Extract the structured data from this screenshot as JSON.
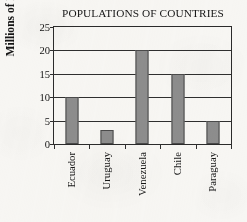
{
  "chart_data": {
    "type": "bar",
    "title": "POPULATIONS OF COUNTRIES",
    "xlabel": "",
    "ylabel": "Millions of People",
    "categories": [
      "Ecuador",
      "Uruguay",
      "Venezuela",
      "Chile",
      "Paraguay"
    ],
    "values": [
      10,
      3,
      20,
      15,
      5
    ],
    "ylim": [
      0,
      25
    ],
    "ytick_labels": [
      "0",
      "5",
      "10",
      "15",
      "20",
      "25"
    ],
    "ytick_values": [
      0,
      5,
      10,
      15,
      20,
      25
    ],
    "grid": "horizontal",
    "legend": "none",
    "bar_color": "#8d8d8d",
    "bar_edge_color": "#4a4a4a",
    "axis_color": "#2f2f2f",
    "background_color": "#f7f6f3"
  }
}
